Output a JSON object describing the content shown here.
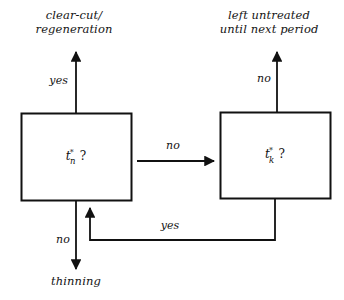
{
  "diagram": {
    "background_color": "#ffffff",
    "stroke_color": "#111111",
    "nodes": [
      {
        "id": "tn",
        "label_full": "t*n ?",
        "symbol": "t",
        "superscript": "*",
        "subscript": "n",
        "suffix": "?",
        "shape": "rectangle"
      },
      {
        "id": "tk",
        "label_full": "t*k ?",
        "symbol": "t",
        "superscript": "*",
        "subscript": "k",
        "suffix": "?",
        "shape": "rectangle"
      }
    ],
    "terminals": [
      {
        "id": "clearcut",
        "text": "clear-cut/\nregeneration"
      },
      {
        "id": "untreated",
        "text": "left untreated\nuntil next period"
      },
      {
        "id": "thinning",
        "text": "thinning"
      }
    ],
    "edges": [
      {
        "id": "tn-to-clearcut",
        "from": "tn",
        "to": "clearcut",
        "label": "yes",
        "direction": "up"
      },
      {
        "id": "tn-to-tk",
        "from": "tn",
        "to": "tk",
        "label": "no",
        "direction": "right"
      },
      {
        "id": "tn-to-thinning",
        "from": "tn",
        "to": "thinning",
        "label": "no",
        "direction": "down"
      },
      {
        "id": "tk-to-untreated",
        "from": "tk",
        "to": "untreated",
        "label": "no",
        "direction": "up"
      },
      {
        "id": "tk-to-tn",
        "from": "tk",
        "to": "tn",
        "label": "yes",
        "direction": "feedback-left"
      }
    ]
  }
}
